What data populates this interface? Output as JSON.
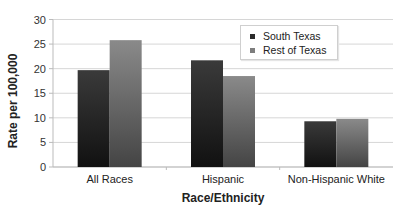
{
  "chart_data": {
    "type": "bar",
    "title": "",
    "xlabel": "Race/Ethnicity",
    "ylabel": "Rate per 100,000",
    "ylim": [
      0,
      30
    ],
    "yticks": [
      0,
      5,
      10,
      15,
      20,
      25,
      30
    ],
    "grid": true,
    "legend_position": "upper right (inside)",
    "categories": [
      "All Races",
      "Hispanic",
      "Non-Hispanic White"
    ],
    "series": [
      {
        "name": "South Texas",
        "color": "#2b2b2b",
        "values": [
          19.7,
          21.7,
          9.3
        ]
      },
      {
        "name": "Rest of Texas",
        "color": "#7d7d7d",
        "values": [
          25.8,
          18.5,
          9.8
        ]
      }
    ]
  }
}
